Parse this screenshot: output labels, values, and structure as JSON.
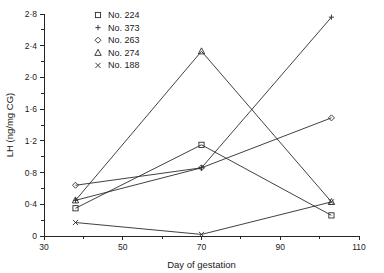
{
  "chart_data": {
    "type": "line",
    "title": "",
    "xlabel": "Day of gestation",
    "ylabel": "LH (ng/mg CG)",
    "xlim": [
      30,
      110
    ],
    "ylim": [
      0,
      2.8
    ],
    "grid": false,
    "legend_position": "top-center",
    "x_ticks_major": [
      "30",
      "50",
      "70",
      "90",
      "110"
    ],
    "x_ticks_major_values": [
      30,
      50,
      70,
      90,
      110
    ],
    "x_ticks_minor_values": [
      40,
      60,
      80,
      100
    ],
    "y_ticks_major": [
      "0",
      "0·4",
      "0·8",
      "1·2",
      "1·6",
      "2·0",
      "2·4",
      "2·8"
    ],
    "y_ticks_major_values": [
      0,
      0.4,
      0.8,
      1.2,
      1.6,
      2.0,
      2.4,
      2.8
    ],
    "y_ticks_minor_values": [
      0.2,
      0.6,
      1.0,
      1.4,
      1.8,
      2.2,
      2.6
    ],
    "series": [
      {
        "name": "No. 224",
        "marker": "square",
        "x": [
          38,
          70,
          103
        ],
        "values": [
          0.35,
          1.15,
          0.26
        ]
      },
      {
        "name": "No. 373",
        "marker": "plus",
        "x": [
          38,
          70,
          103
        ],
        "values": [
          0.45,
          0.86,
          2.76
        ]
      },
      {
        "name": "No. 263",
        "marker": "diamond",
        "x": [
          38,
          70,
          103
        ],
        "values": [
          0.64,
          0.86,
          1.49
        ]
      },
      {
        "name": "No. 274",
        "marker": "triangle",
        "x": [
          38,
          70,
          103
        ],
        "values": [
          0.45,
          2.33,
          0.43
        ]
      },
      {
        "name": "No. 188",
        "marker": "cross",
        "x": [
          38,
          70,
          103
        ],
        "values": [
          0.17,
          0.02,
          0.43
        ]
      }
    ]
  },
  "legend": {
    "items": [
      {
        "label": "No. 224",
        "marker": "square"
      },
      {
        "label": "No. 373",
        "marker": "plus"
      },
      {
        "label": "No. 263",
        "marker": "diamond"
      },
      {
        "label": "No. 274",
        "marker": "triangle"
      },
      {
        "label": "No. 188",
        "marker": "cross"
      }
    ]
  },
  "colors": {
    "ink": "#2b2b2b",
    "axis": "#262626",
    "background": "#ffffff"
  }
}
